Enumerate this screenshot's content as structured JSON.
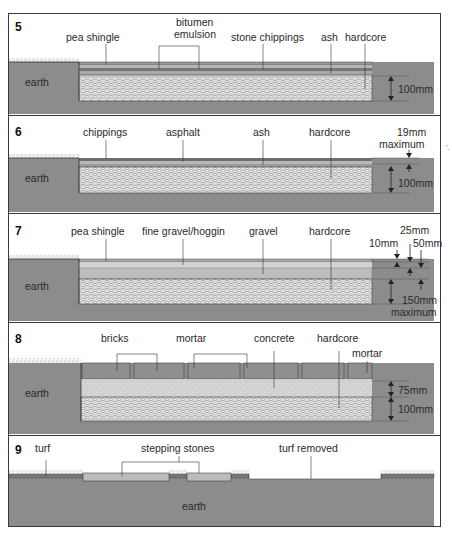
{
  "figure": {
    "panels": [
      {
        "number": "5",
        "labels": {
          "pea_shingle": "pea shingle",
          "bitumen_1": "bitumen",
          "bitumen_2": "emulsion",
          "stone_chippings": "stone chippings",
          "ash": "ash",
          "hardcore": "hardcore",
          "earth": "earth"
        },
        "dimensions": [
          "100mm"
        ]
      },
      {
        "number": "6",
        "labels": {
          "chippings": "chippings",
          "asphalt": "asphalt",
          "ash": "ash",
          "hardcore": "hardcore",
          "earth": "earth"
        },
        "dimensions": [
          "19mm",
          "maximum",
          "100mm"
        ]
      },
      {
        "number": "7",
        "labels": {
          "pea_shingle": "pea shingle",
          "fine_gravel": "fine gravel/hoggin",
          "gravel": "gravel",
          "hardcore": "hardcore",
          "earth": "earth"
        },
        "dimensions": [
          "25mm",
          "10mm",
          "50mm",
          "150mm",
          "maximum"
        ]
      },
      {
        "number": "8",
        "labels": {
          "bricks": "bricks",
          "mortar": "mortar",
          "concrete": "concrete",
          "hardcore": "hardcore",
          "mortar_right": "mortar",
          "earth": "earth"
        },
        "dimensions": [
          "75mm",
          "100mm"
        ]
      },
      {
        "number": "9",
        "labels": {
          "turf": "turf",
          "stepping_stones": "stepping stones",
          "turf_removed": "turf removed",
          "earth": "earth"
        },
        "dimensions": []
      }
    ],
    "stray_mark": "'.",
    "colors": {
      "earth": "#8a8a8a",
      "hardcore_bg": "#d9d9d9",
      "outline": "#3a3a3a",
      "light_fill": "#c8c8c8",
      "concrete": "#d6d6d6"
    }
  }
}
